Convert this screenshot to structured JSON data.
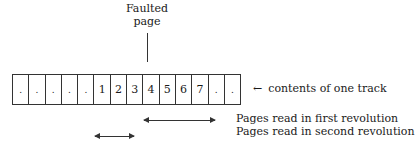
{
  "faulted_page": {
    "label_line1": "Faulted",
    "label_line2": "page"
  },
  "track": {
    "cells": [
      ".",
      ".",
      ".",
      ".",
      ".",
      "1",
      "2",
      "3",
      "4",
      "5",
      "6",
      "7",
      ".",
      "."
    ],
    "label": "contents of one track",
    "arrow_symbol": "←"
  },
  "legend": {
    "first_revolution": "Pages read in first revolution",
    "second_revolution": "Pages read in second revolution"
  },
  "arrows": {
    "first_revolution": {
      "x1": 144,
      "x2": 215,
      "y": 120
    },
    "second_revolution": {
      "x1": 95,
      "x2": 134,
      "y": 136
    }
  }
}
